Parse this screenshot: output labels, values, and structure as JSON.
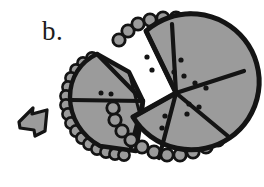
{
  "figure": {
    "label": "b.",
    "caption_letter": "b.",
    "kind": "hand-drawn ink illustration",
    "colors": {
      "ink": "#141414",
      "fill_gray": "#9b9b9b",
      "fill_gray_light": "#a8a8a8",
      "background": "#ffffff",
      "dot": "#141414"
    },
    "objects": [
      {
        "name": "main-disk",
        "description": "large circular disk with beaded rim, divided into five radiating wedges",
        "wedge_count": 5,
        "bead_count": 30,
        "center": [
          176,
          93
        ],
        "radius": 74,
        "wedges": [
          {
            "name": "wedge-top-left",
            "dots": 2
          },
          {
            "name": "wedge-top-right",
            "dots": 3
          },
          {
            "name": "wedge-right",
            "dots": 2
          },
          {
            "name": "wedge-bottom-right",
            "dots": 3
          },
          {
            "name": "wedge-bottom-left",
            "dots": 2
          }
        ]
      },
      {
        "name": "detached-fragment",
        "description": "broken-off portion of the disk containing two wedges, beaded rim on outer edge",
        "wedge_count": 2,
        "bead_count": 16,
        "center": [
          131,
          99
        ],
        "radius": 57,
        "wedges": [
          {
            "name": "fragment-wedge-upper",
            "dots": 2
          },
          {
            "name": "fragment-wedge-lower",
            "dots": 3
          }
        ]
      },
      {
        "name": "small-arrow-fragment",
        "description": "small angular arrow-shaped shard lying to the left",
        "dots": 0
      }
    ]
  }
}
